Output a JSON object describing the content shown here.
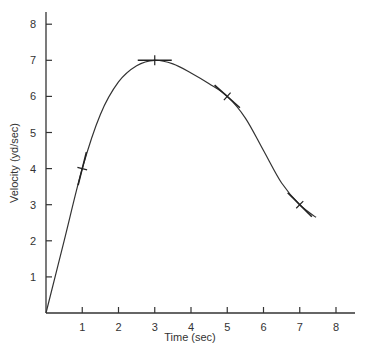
{
  "chart_data": {
    "type": "line",
    "title": "",
    "xlabel": "Time (sec)",
    "ylabel": "Velocity (yd/sec)",
    "xlim": [
      0,
      8.5
    ],
    "ylim": [
      0,
      8.3
    ],
    "x_ticks": [
      1,
      2,
      3,
      4,
      5,
      6,
      7,
      8
    ],
    "y_ticks": [
      1,
      2,
      3,
      4,
      5,
      6,
      7,
      8
    ],
    "grid": false,
    "legend": null,
    "series": [
      {
        "name": "velocity",
        "x": [
          0,
          0.5,
          1,
          1.5,
          2,
          2.5,
          3,
          3.5,
          4,
          4.5,
          5,
          5.5,
          6,
          6.5,
          7,
          7.45
        ],
        "y": [
          0,
          2.0,
          4.0,
          5.5,
          6.4,
          6.85,
          7.0,
          6.9,
          6.65,
          6.35,
          6.0,
          5.4,
          4.5,
          3.6,
          3.0,
          2.65
        ]
      }
    ],
    "tangent_marks": [
      {
        "x": 1,
        "y": 4,
        "slope": 4.0
      },
      {
        "x": 3,
        "y": 7,
        "slope": 0
      },
      {
        "x": 5,
        "y": 6,
        "slope": -0.9
      },
      {
        "x": 7,
        "y": 3,
        "slope": -1.0
      }
    ]
  },
  "labels": {
    "xlabel": "Time (sec)",
    "ylabel": "Velocity (yd/sec)",
    "xticks": [
      "1",
      "2",
      "3",
      "4",
      "5",
      "6",
      "7",
      "8"
    ],
    "yticks": [
      "1",
      "2",
      "3",
      "4",
      "5",
      "6",
      "7",
      "8"
    ]
  }
}
